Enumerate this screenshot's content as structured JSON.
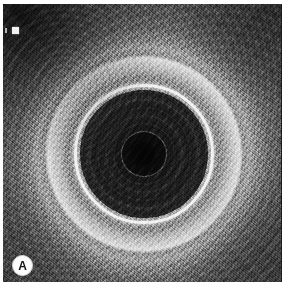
{
  "figure": {
    "panel_label": "A",
    "modality": "endoscopic-ultrasound",
    "orientation": "axial"
  },
  "annotations": {
    "depth_marker": {
      "name": "depth-scale-marker",
      "shape": "filled-square",
      "color": "#f2f2f2",
      "position": "top-left"
    },
    "scale_tick": {
      "name": "scale-tick",
      "shape": "vertical-bar",
      "color": "#cfcfcf",
      "position": "left-edge"
    },
    "panel_badge": {
      "name": "panel-label-badge",
      "text": "A",
      "background": "#fdfdfd",
      "text_color": "#141414",
      "position": "bottom-left"
    }
  },
  "image_regions": [
    {
      "name": "outer-tissue-field",
      "echogenicity": "mixed speckled",
      "tone": "#8d8d8d"
    },
    {
      "name": "dark-corner-vignette",
      "echogenicity": "hypoechoic",
      "tone": "#141414"
    },
    {
      "name": "bright-outer-halo",
      "echogenicity": "hyperechoic",
      "tone": "#fafafa"
    },
    {
      "name": "interface-ring",
      "echogenicity": "hyperechoic",
      "tone": "#f8f8f8"
    },
    {
      "name": "anechoic-lumen",
      "echogenicity": "anechoic",
      "tone": "#1b1b1b"
    },
    {
      "name": "central-core",
      "echogenicity": "anechoic",
      "tone": "#060606"
    }
  ],
  "palette": {
    "background": "#ffffff",
    "tissue_mid": "#8d8d8d",
    "tissue_bright": "#fafafa",
    "lumen_dark": "#1b1b1b",
    "core_black": "#060606",
    "label_white": "#fdfdfd",
    "label_text": "#141414"
  }
}
